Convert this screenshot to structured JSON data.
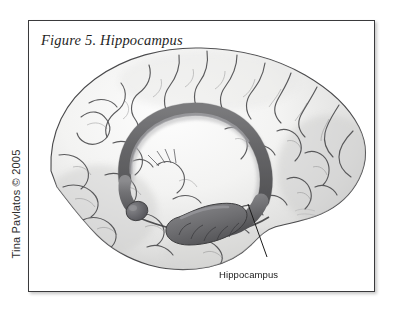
{
  "figure": {
    "caption": "Figure 5. Hippocampus",
    "copyright": "Tina Pavlatos © 2005",
    "artist_mark": "Tina Pavlatos",
    "background_color": "#ffffff",
    "border_color": "#3a3a3c"
  },
  "labels": {
    "hippocampus": "Hippocampus"
  },
  "illustration": {
    "subject": "human brain, medial sagittal view",
    "style": "grayscale pencil and airbrush medical illustration",
    "cortex_fill": "#f2f2f1",
    "sulci_color": "#4a4a4a",
    "structure_fill": "#6e6e70",
    "structure_outline": "#3c3c3e",
    "leader_line_color": "#1a1a1a",
    "structures": [
      "fornix arc",
      "hippocampal head with digitations",
      "cerebral cortex with gyri and sulci"
    ]
  }
}
